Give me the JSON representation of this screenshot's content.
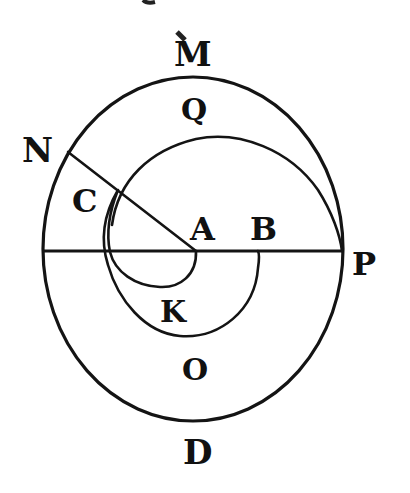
{
  "diagram": {
    "type": "geometric-figure",
    "colors": {
      "ink": "#141414",
      "background": "#ffffff"
    },
    "labels": {
      "M": "M",
      "Q": "Q",
      "N": "N",
      "C": "C",
      "A": "A",
      "B": "B",
      "P": "P",
      "K": "K",
      "O": "O",
      "D": "D"
    },
    "shapes": [
      {
        "name": "outer-circle",
        "kind": "ellipse",
        "cx": 193,
        "cy": 250,
        "rx": 150,
        "ry": 172
      },
      {
        "name": "horizontal-line",
        "from": "left-circle-edge",
        "to": "P"
      },
      {
        "name": "radius-line",
        "from": "N",
        "to": "A"
      },
      {
        "name": "spiral",
        "from": "A",
        "through": [
          "K",
          "B",
          "Q"
        ],
        "to": "P"
      }
    ]
  }
}
